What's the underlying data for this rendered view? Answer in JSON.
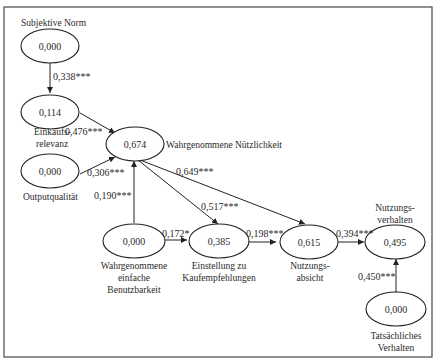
{
  "diagram": {
    "type": "structural path model",
    "nodes": [
      {
        "id": "subjektive_norm",
        "value": "0,000",
        "label": [
          "Subjektive Norm"
        ]
      },
      {
        "id": "einkaufsrelevanz",
        "value": "0,114",
        "label": [
          "Einkaufs-",
          "relevanz"
        ]
      },
      {
        "id": "outputqualitaet",
        "value": "0,000",
        "label": [
          "Outputqualität"
        ]
      },
      {
        "id": "nuetzlichkeit",
        "value": "0,674",
        "label": [
          "Wahrgenommene Nützlichkeit"
        ]
      },
      {
        "id": "benutzbarkeit",
        "value": "0,000",
        "label": [
          "Wahrgenommene",
          "einfache",
          "Benutzbarkeit"
        ]
      },
      {
        "id": "einstellung",
        "value": "0,385",
        "label": [
          "Einstellung zu",
          "Kaufempfehlungen"
        ]
      },
      {
        "id": "nutzungsabsicht",
        "value": "0,615",
        "label": [
          "Nutzungs-",
          "absicht"
        ]
      },
      {
        "id": "nutzungsverhalten",
        "value": "0,495",
        "label": [
          "Nutzungs-",
          "verhalten"
        ]
      },
      {
        "id": "tatsaechliches",
        "value": "0,000",
        "label": [
          "Tatsächliches",
          "Verhalten"
        ]
      }
    ],
    "edges": [
      {
        "from": "subjektive_norm",
        "to": "einkaufsrelevanz",
        "coef": "0,338***"
      },
      {
        "from": "einkaufsrelevanz",
        "to": "nuetzlichkeit",
        "coef": "0,476***"
      },
      {
        "from": "outputqualitaet",
        "to": "nuetzlichkeit",
        "coef": "0,306***"
      },
      {
        "from": "benutzbarkeit",
        "to": "nuetzlichkeit",
        "coef": "0,190***"
      },
      {
        "from": "nuetzlichkeit",
        "to": "einstellung",
        "coef": "0,517***"
      },
      {
        "from": "nuetzlichkeit",
        "to": "nutzungsabsicht",
        "coef": "0,649***"
      },
      {
        "from": "benutzbarkeit",
        "to": "einstellung",
        "coef": "0,172*"
      },
      {
        "from": "einstellung",
        "to": "nutzungsabsicht",
        "coef": "0,198***"
      },
      {
        "from": "nutzungsabsicht",
        "to": "nutzungsverhalten",
        "coef": "0,394***"
      },
      {
        "from": "tatsaechliches",
        "to": "nutzungsverhalten",
        "coef": "0,450***"
      }
    ]
  },
  "labels": {
    "subjektive_norm": "Subjektive Norm",
    "einkaufs_1": "Einkaufs-",
    "einkaufs_2": "relevanz",
    "outputqualitaet": "Outputqualität",
    "nuetzlichkeit": "Wahrgenommene Nützlichkeit",
    "benutzbarkeit_1": "Wahrgenommene",
    "benutzbarkeit_2": "einfache",
    "benutzbarkeit_3": "Benutzbarkeit",
    "einstellung_1": "Einstellung zu",
    "einstellung_2": "Kaufempfehlungen",
    "absicht_1": "Nutzungs-",
    "absicht_2": "absicht",
    "verhalten_1": "Nutzungs-",
    "verhalten_2": "verhalten",
    "tats_1": "Tatsächliches",
    "tats_2": "Verhalten"
  },
  "values": {
    "subjektive_norm": "0,000",
    "einkaufsrelevanz": "0,114",
    "outputqualitaet": "0,000",
    "nuetzlichkeit": "0,674",
    "benutzbarkeit": "0,000",
    "einstellung": "0,385",
    "nutzungsabsicht": "0,615",
    "nutzungsverhalten": "0,495",
    "tatsaechliches": "0,000"
  },
  "coefs": {
    "sn_er": "0,338***",
    "er_nu": "0,476***",
    "oq_nu": "0,306***",
    "bb_nu": "0,190***",
    "nu_ei": "0,517***",
    "nu_na": "0,649***",
    "bb_ei": "0,172*",
    "ei_na": "0,198***",
    "na_nv": "0,394***",
    "tv_nv": "0,450***"
  }
}
